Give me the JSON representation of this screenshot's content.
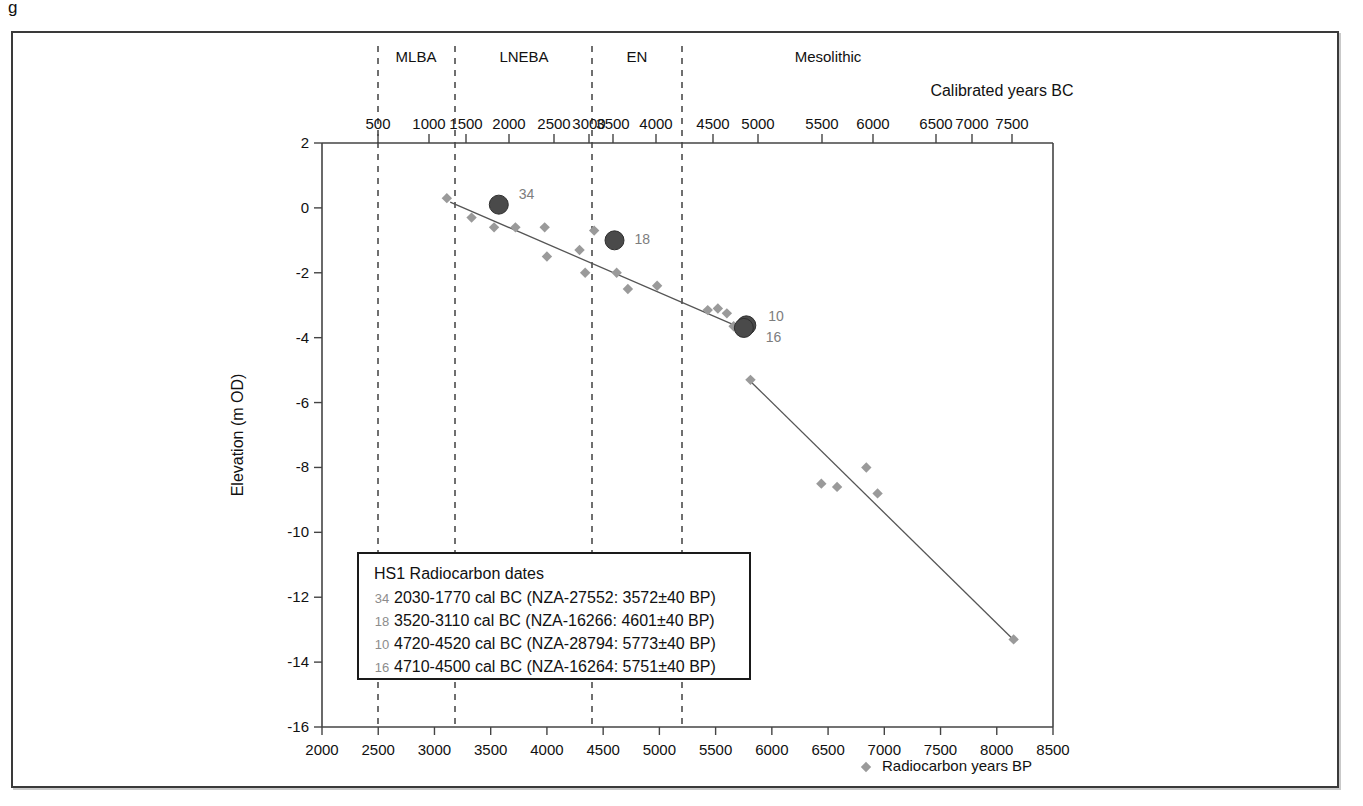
{
  "figure": {
    "caption_stub": "g",
    "background": "#ffffff",
    "frame_color": "#3a3a3a"
  },
  "colors": {
    "marker_gray": "#9a9a9a",
    "highlight_dark": "#4a4a4a",
    "trend_line": "#555555",
    "divider_dashed": "#333333",
    "axis": "#444444",
    "label_gray": "#7d7d7d"
  },
  "top_axis": {
    "title": "Calibrated years BC",
    "tick_labels": [
      "500",
      "1000",
      "1500",
      "2000",
      "2500",
      "3000",
      "3500",
      "4000",
      "4500",
      "5000",
      "5500",
      "6000",
      "6500",
      "7000",
      "7500"
    ],
    "tick_x_px": [
      378,
      429,
      466,
      509,
      554,
      589,
      613,
      656,
      713,
      758,
      822,
      873,
      936,
      972,
      1012
    ]
  },
  "periods": [
    {
      "label": "MLBA",
      "center_x_px": 416
    },
    {
      "label": "LNEBA",
      "center_x_px": 524
    },
    {
      "label": "EN",
      "center_x_px": 637
    },
    {
      "label": "Mesolithic",
      "center_x_px": 828
    }
  ],
  "period_dividers_x_px": [
    378,
    455,
    592,
    682
  ],
  "bottom_axis": {
    "title": "Radiocarbon years BP",
    "marker_icon": "diamond-marker-icon",
    "tick_labels": [
      "2000",
      "2500",
      "3000",
      "3500",
      "4000",
      "4500",
      "5000",
      "5500",
      "6000",
      "6500",
      "7000",
      "7500",
      "8000",
      "8500"
    ],
    "min": 2000,
    "max": 8500,
    "step": 500
  },
  "y_axis": {
    "title": "Elevation (m OD)",
    "tick_labels": [
      "2",
      "0",
      "-2",
      "-4",
      "-6",
      "-8",
      "-10",
      "-12",
      "-14",
      "-16"
    ],
    "min": -16,
    "max": 2,
    "step": 2
  },
  "legend_box": {
    "title": "HS1 Radiocarbon dates",
    "rows": [
      {
        "num": "34",
        "text": "2030-1770 cal BC (NZA-27552: 3572±40 BP)"
      },
      {
        "num": "18",
        "text": "3520-3110 cal BC (NZA-16266: 4601±40 BP)"
      },
      {
        "num": "10",
        "text": "4720-4520 cal BC (NZA-28794: 5773±40 BP)"
      },
      {
        "num": "16",
        "text": "4710-4500 cal BC (NZA-16264: 5751±40 BP)"
      }
    ]
  },
  "chart_data": {
    "type": "scatter",
    "title": "",
    "xlabel": "Radiocarbon years BP",
    "ylabel": "Elevation (m OD)",
    "xlim": [
      2000,
      8500
    ],
    "ylim": [
      -16,
      2
    ],
    "grid": false,
    "legend": "Radiocarbon years BP",
    "secondary_x_axis": {
      "label": "Calibrated years BC",
      "direction": "increasing-left-to-right"
    },
    "series": [
      {
        "name": "Radiocarbon years BP",
        "marker": "diamond",
        "color": "#9a9a9a",
        "points": [
          {
            "x": 3110,
            "y": 0.3
          },
          {
            "x": 3330,
            "y": -0.3
          },
          {
            "x": 3530,
            "y": -0.6
          },
          {
            "x": 3720,
            "y": -0.6
          },
          {
            "x": 3980,
            "y": -0.6
          },
          {
            "x": 4000,
            "y": -1.5
          },
          {
            "x": 4290,
            "y": -1.3
          },
          {
            "x": 4340,
            "y": -2.0
          },
          {
            "x": 4420,
            "y": -0.7
          },
          {
            "x": 4620,
            "y": -2.0
          },
          {
            "x": 4720,
            "y": -2.5
          },
          {
            "x": 4980,
            "y": -2.4
          },
          {
            "x": 5430,
            "y": -3.15
          },
          {
            "x": 5520,
            "y": -3.1
          },
          {
            "x": 5600,
            "y": -3.25
          },
          {
            "x": 5660,
            "y": -3.65
          },
          {
            "x": 5810,
            "y": -5.3
          },
          {
            "x": 6440,
            "y": -8.5
          },
          {
            "x": 6580,
            "y": -8.6
          },
          {
            "x": 6840,
            "y": -8.0
          },
          {
            "x": 6940,
            "y": -8.8
          },
          {
            "x": 8150,
            "y": -13.3
          }
        ]
      },
      {
        "name": "Dated samples",
        "marker": "circle",
        "color": "#4a4a4a",
        "points": [
          {
            "x": 3572,
            "y": 0.1,
            "label": "34"
          },
          {
            "x": 4601,
            "y": -1.0,
            "label": "18"
          },
          {
            "x": 5773,
            "y": -3.62,
            "label": "10"
          },
          {
            "x": 5751,
            "y": -3.7,
            "label": "16"
          }
        ]
      }
    ],
    "trend_lines": [
      {
        "name": "upper-trend",
        "x0": 3140,
        "y0": 0.18,
        "x1": 5760,
        "y1": -3.75
      },
      {
        "name": "lower-trend",
        "x0": 5820,
        "y0": -5.38,
        "x1": 8160,
        "y1": -13.35
      }
    ]
  }
}
